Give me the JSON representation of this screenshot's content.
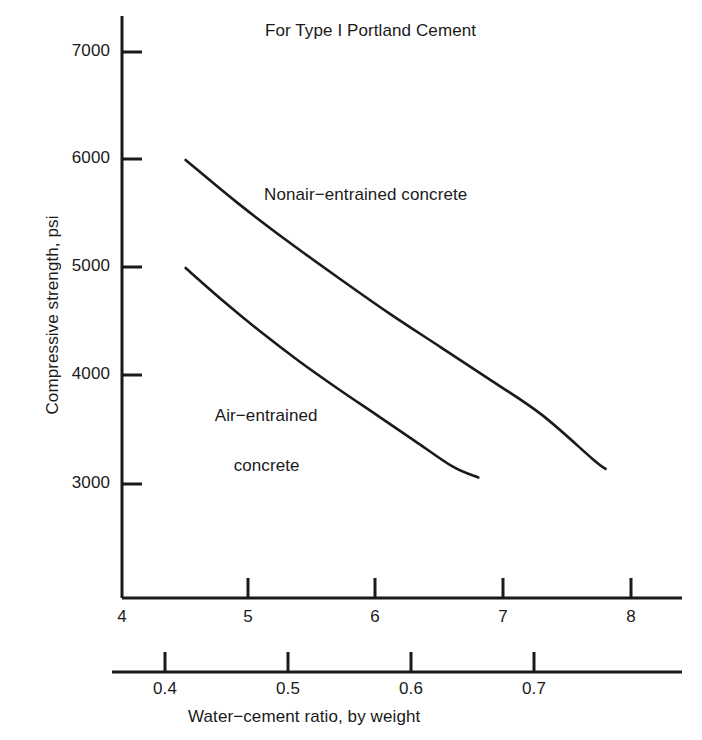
{
  "chart_data": {
    "type": "line",
    "title": "For Type I Portland Cement",
    "xlabel": "",
    "ylabel": "Compressive strength, psi",
    "secondary_xlabel": "Water−cement ratio, by weight",
    "xlim": [
      4,
      8.4
    ],
    "ylim": [
      2350,
      7300
    ],
    "grid": false,
    "legend_position": "inline-annotations",
    "xticks": [
      4,
      5,
      6,
      7,
      8
    ],
    "xtick_labels": [
      "4",
      "5",
      "6",
      "7",
      "8"
    ],
    "yticks": [
      3000,
      4000,
      5000,
      6000,
      7000
    ],
    "ytick_labels": [
      "3000",
      "4000",
      "5000",
      "6000",
      "7000"
    ],
    "secondary_xticks": [
      0.4,
      0.5,
      0.6,
      0.7
    ],
    "secondary_xtick_labels": [
      "0.4",
      "0.5",
      "0.6",
      "0.7"
    ],
    "secondary_axis_range": [
      0.35,
      0.78
    ],
    "series": [
      {
        "name": "Nonair−entrained concrete",
        "x": [
          4.5,
          4.9,
          5.3,
          5.7,
          6.1,
          6.5,
          6.9,
          7.3,
          7.7,
          7.8
        ],
        "values": [
          6000,
          5610,
          5250,
          4910,
          4580,
          4270,
          3960,
          3640,
          3230,
          3140
        ]
      },
      {
        "name": "Air−entrained concrete",
        "x": [
          4.5,
          4.8,
          5.1,
          5.4,
          5.7,
          6.0,
          6.3,
          6.6,
          6.8
        ],
        "values": [
          5000,
          4690,
          4400,
          4130,
          3880,
          3640,
          3400,
          3160,
          3060
        ]
      }
    ],
    "annotations": [
      {
        "text": "Nonair−entrained concrete",
        "x": 5.1,
        "y": 5550
      },
      {
        "text": "Air−entrained concrete",
        "x": 4.45,
        "y": 3870
      }
    ]
  },
  "axis": {
    "y_title": "Compressive strength, psi",
    "x_secondary_title": "Water−cement ratio, by weight"
  },
  "series_labels": {
    "nonair": "Nonair−entrained concrete",
    "air_line1": "Air−entrained",
    "air_line2": "concrete"
  },
  "colors": {
    "ink": "#1a1a1a",
    "background": "#ffffff",
    "curve": "#1a1a1a"
  }
}
